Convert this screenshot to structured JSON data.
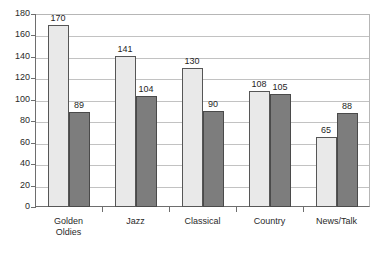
{
  "chart_data": {
    "type": "bar",
    "title": "",
    "subtitle": "",
    "xlabel": "",
    "ylabel": "",
    "categories": [
      "Golden\nOldies",
      "Jazz",
      "Classical",
      "Country",
      "News/Talk"
    ],
    "category_labels_flat": [
      "Golden Oldies",
      "Jazz",
      "Classical",
      "Country",
      "News/Talk"
    ],
    "series": [
      {
        "name": "series-1",
        "color": "#e9e9e9",
        "border_color": "#565656",
        "values": [
          170,
          141,
          130,
          108,
          65
        ]
      },
      {
        "name": "series-2",
        "color": "#7d7d7d",
        "border_color": "#4a4a4a",
        "values": [
          89,
          104,
          90,
          105,
          88
        ]
      }
    ],
    "ylim": [
      0,
      180
    ],
    "ytick_step": 20,
    "yticks": [
      0,
      20,
      40,
      60,
      80,
      100,
      120,
      140,
      160,
      180
    ],
    "ytick_labels": [
      "0",
      "20",
      "40",
      "60",
      "80",
      "100",
      "120",
      "140",
      "160",
      "180"
    ],
    "grid": true,
    "grid_axis": "y",
    "legend": false,
    "legend_position": "none",
    "data_labels": true,
    "plot_background": "#ffffff",
    "grid_color": "#c2c2c2",
    "axis_color": "#6e6e6e"
  }
}
